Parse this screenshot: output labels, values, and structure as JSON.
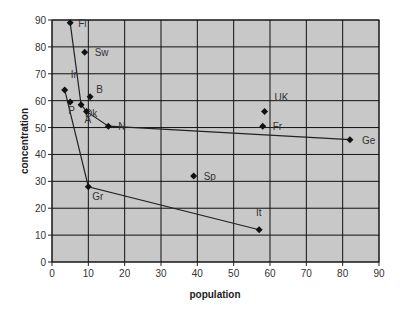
{
  "chart_data": {
    "type": "scatter",
    "title": "",
    "xlabel": "population",
    "ylabel": "concentration",
    "xlim": [
      0,
      90
    ],
    "ylim": [
      0,
      90
    ],
    "xticks": [
      0,
      10,
      20,
      30,
      40,
      50,
      60,
      70,
      80,
      90
    ],
    "yticks": [
      0,
      10,
      20,
      30,
      40,
      50,
      60,
      70,
      80,
      90
    ],
    "grid": true,
    "legend": null,
    "plot_background": "#c8c8c8",
    "points": [
      {
        "label": "Fi",
        "x": 5,
        "y": 89
      },
      {
        "label": "Sw",
        "x": 9,
        "y": 78
      },
      {
        "label": "Ir",
        "x": 3.5,
        "y": 64
      },
      {
        "label": "B",
        "x": 10.5,
        "y": 61.5
      },
      {
        "label": "P",
        "x": 5,
        "y": 59.5
      },
      {
        "label": "Dk",
        "x": 8,
        "y": 58.5
      },
      {
        "label": "A",
        "x": 9.5,
        "y": 56
      },
      {
        "label": "N",
        "x": 15.5,
        "y": 50.5
      },
      {
        "label": "UK",
        "x": 58.5,
        "y": 56
      },
      {
        "label": "Fr",
        "x": 58,
        "y": 50.5
      },
      {
        "label": "Ge",
        "x": 82,
        "y": 45.5
      },
      {
        "label": "Sp",
        "x": 39,
        "y": 32
      },
      {
        "label": "Gr",
        "x": 10,
        "y": 28
      },
      {
        "label": "It",
        "x": 57,
        "y": 12
      }
    ],
    "lines": [
      {
        "name": "frontier-upper",
        "path": [
          "Fi",
          "Dk",
          "A",
          "N",
          "Ge"
        ]
      },
      {
        "name": "frontier-lower",
        "path": [
          "Ir",
          "Gr",
          "It"
        ]
      }
    ],
    "label_offsets": {
      "Fi": [
        8,
        4
      ],
      "Sw": [
        10,
        4
      ],
      "Ir": [
        6,
        -12
      ],
      "B": [
        6,
        -4
      ],
      "P": [
        -2,
        12
      ],
      "Dk": [
        4,
        12
      ],
      "A": [
        -2,
        12
      ],
      "N": [
        10,
        4
      ],
      "UK": [
        10,
        -10
      ],
      "Fr": [
        10,
        4
      ],
      "Ge": [
        12,
        4
      ],
      "Sp": [
        10,
        4
      ],
      "Gr": [
        4,
        13
      ],
      "It": [
        -3,
        -14
      ]
    }
  }
}
